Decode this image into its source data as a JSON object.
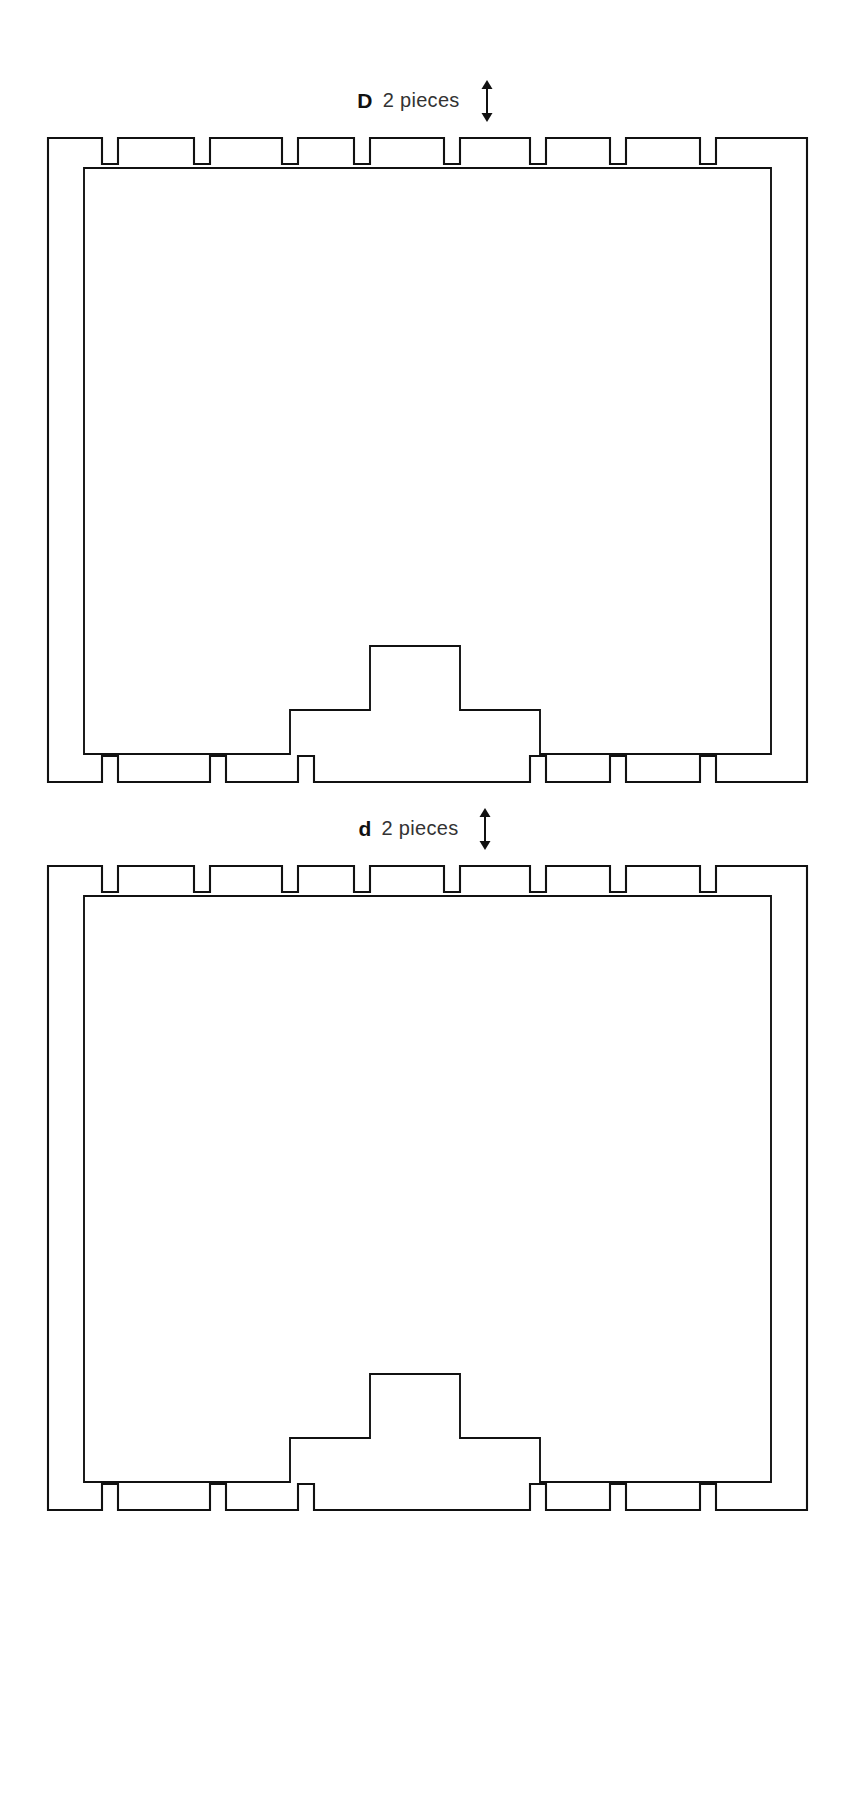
{
  "document": {
    "type": "technical-line-drawing",
    "title": "Panel cut pattern sheet",
    "background_color": "#ffffff",
    "line_color": "#111111"
  },
  "pieces": [
    {
      "code": "D",
      "quantity_label": "2 pieces",
      "orientation_icon": "double-headed-vertical-arrow",
      "description": "Large panel with edge notches and stepped bottom cutout"
    },
    {
      "code": "d",
      "quantity_label": "2 pieces",
      "orientation_icon": "double-headed-vertical-arrow",
      "description": "Large panel with edge notches and stepped bottom cutout"
    }
  ],
  "geometry": {
    "outer": {
      "x": 8,
      "y": 8,
      "width": 759,
      "height": 656
    },
    "inner": {
      "x": 40,
      "y": 40,
      "width": 695,
      "height": 600
    },
    "top_notches_x": [
      62,
      170,
      258,
      330,
      410,
      490,
      570
    ],
    "bottom_notches_x": [
      62,
      170,
      258,
      490,
      570,
      660
    ],
    "notch_width": 16,
    "notch_depth": 26,
    "step_cutout": {
      "low_left_x": 250,
      "low_left_width": 130,
      "low_rise": 44,
      "high_x": 330,
      "high_width": 90,
      "high_rise": 108,
      "low_right_x": 390,
      "low_right_width": 130
    }
  },
  "colors": {
    "line": "#111111",
    "paper": "#ffffff",
    "label_code": "#111111",
    "label_qty": "#333333"
  }
}
